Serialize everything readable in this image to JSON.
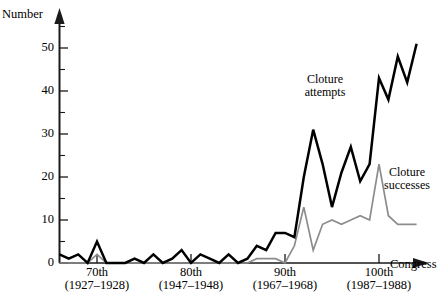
{
  "axes": {
    "y_title": "Number",
    "x_title": "Congress",
    "y_ticks": [
      0,
      10,
      20,
      30,
      40,
      50
    ],
    "y_minor_ticks": [
      5,
      15,
      25,
      35,
      45,
      55
    ],
    "x_ticks": [
      {
        "era": "70th",
        "years": "(1927–1928)",
        "congress": 70
      },
      {
        "era": "80th",
        "years": "(1947–1948)",
        "congress": 80
      },
      {
        "era": "90th",
        "years": "(1967–1968)",
        "congress": 90
      },
      {
        "era": "100th",
        "years": "(1987–1988)",
        "congress": 100
      }
    ]
  },
  "annotations": {
    "attempts": "Cloture\nattempts",
    "attempts_line1": "Cloture",
    "attempts_line2": "attempts",
    "successes_line1": "Cloture",
    "successes_line2": "successes"
  },
  "colors": {
    "attempts": "#000000",
    "successes": "#8c8c8c",
    "axis": "#1a1a1a",
    "background": "#ffffff"
  },
  "chart_data": {
    "type": "line",
    "title": "",
    "xlabel": "Congress",
    "ylabel": "Number",
    "xlim": [
      66,
      104
    ],
    "ylim": [
      0,
      56
    ],
    "grid": false,
    "legend": "inline-annotations",
    "x": [
      66,
      67,
      68,
      69,
      70,
      71,
      72,
      73,
      74,
      75,
      76,
      77,
      78,
      79,
      80,
      81,
      82,
      83,
      84,
      85,
      86,
      87,
      88,
      89,
      90,
      91,
      92,
      93,
      94,
      95,
      96,
      97,
      98,
      99,
      100,
      101,
      102,
      103,
      104
    ],
    "series": [
      {
        "name": "Cloture attempts",
        "color": "#000000",
        "values": [
          2,
          1,
          2,
          0,
          5,
          0,
          0,
          0,
          1,
          0,
          2,
          0,
          1,
          3,
          0,
          2,
          1,
          0,
          2,
          0,
          1,
          4,
          3,
          7,
          7,
          6,
          20,
          31,
          23,
          13,
          21,
          27,
          19,
          23,
          43,
          38,
          48,
          42,
          51
        ]
      },
      {
        "name": "Cloture successes",
        "color": "#8c8c8c",
        "values": [
          0,
          0,
          0,
          0,
          2,
          0,
          0,
          0,
          0,
          0,
          0,
          0,
          0,
          0,
          0,
          0,
          0,
          0,
          0,
          0,
          0,
          1,
          1,
          1,
          0,
          4,
          13,
          3,
          9,
          10,
          9,
          10,
          11,
          10,
          23,
          11,
          9,
          9,
          9
        ]
      }
    ]
  }
}
